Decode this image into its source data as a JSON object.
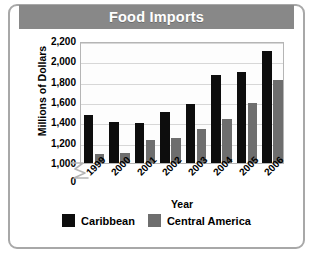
{
  "chart_data": {
    "type": "bar",
    "title": "Food Imports",
    "xlabel": "Year",
    "ylabel": "Millions of Dollars",
    "categories": [
      "1999",
      "2000",
      "2001",
      "2002",
      "2003",
      "2004",
      "2005",
      "2006"
    ],
    "series": [
      {
        "name": "Caribbean",
        "color": "#0d0d0d",
        "values": [
          1470,
          1400,
          1390,
          1500,
          1580,
          1870,
          1900,
          2100
        ]
      },
      {
        "name": "Central America",
        "color": "#6e6e6e",
        "values": [
          1090,
          1100,
          1230,
          1250,
          1330,
          1430,
          1590,
          1820
        ]
      }
    ],
    "ylim": [
      1000,
      2200
    ],
    "axis_break": true,
    "axis_break_label": "0",
    "ytick_labels": [
      "2,200",
      "2,000",
      "1,800",
      "1,600",
      "1,400",
      "1,200",
      "1,000",
      "0"
    ],
    "ytick_values": [
      2200,
      2000,
      1800,
      1600,
      1400,
      1200,
      1000,
      0
    ],
    "grid": true,
    "legend_position": "bottom"
  },
  "title_band": {
    "text": "Food Imports",
    "background": "#888888",
    "text_color": "#ffffff"
  }
}
